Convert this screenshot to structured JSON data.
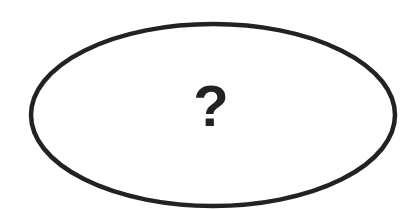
{
  "diagram": {
    "shape": "ellipse",
    "label": "?",
    "stroke_color": "#222222",
    "fill_color": "#ffffff",
    "text_color": "#222222"
  }
}
